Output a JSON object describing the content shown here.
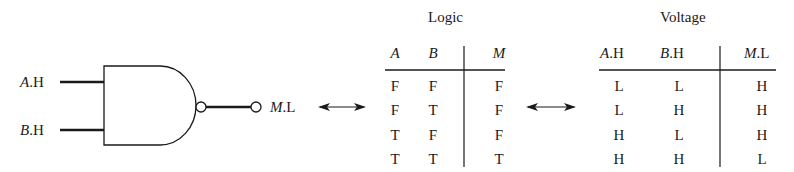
{
  "gate": {
    "type": "NAND",
    "inputs": [
      {
        "var": "A",
        "suffix": ".H"
      },
      {
        "var": "B",
        "suffix": ".H"
      }
    ],
    "output": {
      "var": "M",
      "suffix": ".L"
    }
  },
  "logic_table": {
    "title": "Logic",
    "headers": [
      "A",
      "B",
      "M"
    ],
    "rows": [
      [
        "F",
        "F",
        "F"
      ],
      [
        "F",
        "T",
        "F"
      ],
      [
        "T",
        "F",
        "F"
      ],
      [
        "T",
        "T",
        "T"
      ]
    ]
  },
  "voltage_table": {
    "title": "Voltage",
    "headers": [
      {
        "var": "A",
        "suffix": ".H"
      },
      {
        "var": "B",
        "suffix": ".H"
      },
      {
        "var": "M",
        "suffix": ".L"
      }
    ],
    "rows": [
      [
        "L",
        "L",
        "H"
      ],
      [
        "L",
        "H",
        "H"
      ],
      [
        "H",
        "L",
        "H"
      ],
      [
        "H",
        "H",
        "L"
      ]
    ]
  },
  "arrows": [
    "double-arrow",
    "double-arrow"
  ]
}
